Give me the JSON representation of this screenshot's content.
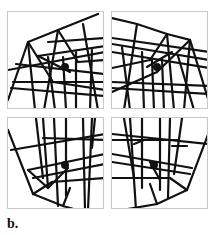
{
  "figure": {
    "label": "b.",
    "panels": [
      {
        "id": "top-left",
        "content": "distorted wireframe cube grid with center dot"
      },
      {
        "id": "top-right",
        "content": "distorted wireframe cube grid with center dot"
      },
      {
        "id": "bottom-left",
        "content": "distorted wireframe cube grid with center dot"
      },
      {
        "id": "bottom-right",
        "content": "distorted wireframe cube grid with center dot"
      }
    ],
    "colors": {
      "line": "#111111",
      "border": "#c8c8c8",
      "background": "#ffffff"
    }
  }
}
